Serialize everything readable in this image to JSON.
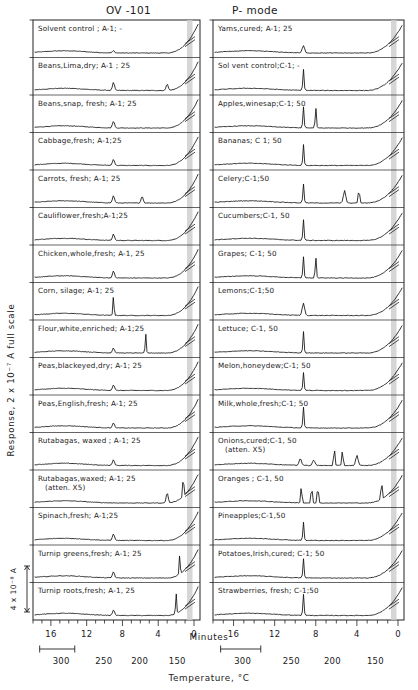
{
  "figure": {
    "column_headers": [
      "OV -101",
      "P- mode"
    ],
    "y_axis_label": "Response, 2 x 10⁻⁷ A full scale",
    "y_scale_bar_label": "4 x 10⁻⁸ A",
    "x_axis_label_top": "Minutes",
    "x_axis_label_bottom": "Temperature, °C"
  },
  "chart_data": {
    "type": "line",
    "xlabel": "Minutes",
    "xlabel_secondary": "Temperature, °C",
    "ylabel": "Response, 2 x 10⁻⁷ A full scale",
    "grid": false,
    "legend": "none",
    "axis_direction": "reversed",
    "xlim": [
      18,
      0
    ],
    "minutes_ticks": [
      16,
      12,
      8,
      4,
      0
    ],
    "minutes_minor_step": 1,
    "temperature_ticks": [
      300,
      250,
      200,
      150
    ],
    "temperature_scalebar_label": "300",
    "panels": [
      {
        "name": "OV -101",
        "column": "left",
        "traces": [
          {
            "label": "Solvent control ; A-1; -",
            "sample": "Solvent control",
            "column_code": "A-1",
            "injection": "-",
            "peaks": [
              {
                "minutes": 9.0,
                "height": 0.1
              }
            ]
          },
          {
            "label": "Beans,Lima,dry; A-1 ; 25",
            "sample": "Beans, Lima, dry",
            "column_code": "A-1",
            "injection": "25",
            "peaks": [
              {
                "minutes": 9.0,
                "height": 0.35
              },
              {
                "minutes": 3.0,
                "height": 0.3
              }
            ]
          },
          {
            "label": "Beans,snap, fresh; A-1; 25",
            "sample": "Beans, snap, fresh",
            "column_code": "A-1",
            "injection": "25",
            "peaks": [
              {
                "minutes": 9.0,
                "height": 0.3
              }
            ]
          },
          {
            "label": "Cabbage,fresh; A-1;25",
            "sample": "Cabbage, fresh",
            "column_code": "A-1",
            "injection": "25",
            "peaks": [
              {
                "minutes": 9.0,
                "height": 0.28
              }
            ]
          },
          {
            "label": "Carrots, fresh; A-1; 25",
            "sample": "Carrots, fresh",
            "column_code": "A-1",
            "injection": "25",
            "peaks": [
              {
                "minutes": 9.0,
                "height": 0.32
              },
              {
                "minutes": 5.8,
                "height": 0.3
              }
            ]
          },
          {
            "label": "Cauliflower,fresh;A-1;25",
            "sample": "Cauliflower, fresh",
            "column_code": "A-1",
            "injection": "25",
            "peaks": [
              {
                "minutes": 9.0,
                "height": 0.28
              }
            ]
          },
          {
            "label": "Chicken,whole,fresh; A-1, 25",
            "sample": "Chicken, whole, fresh",
            "column_code": "A-1",
            "injection": "25",
            "peaks": [
              {
                "minutes": 9.0,
                "height": 0.3
              }
            ]
          },
          {
            "label": "Corn, silage; A-1; 25",
            "sample": "Corn, silage",
            "column_code": "A-1",
            "injection": "25",
            "peaks": [
              {
                "minutes": 9.0,
                "height": 0.9
              }
            ]
          },
          {
            "label": "Flour,white,enriched; A-1;25",
            "sample": "Flour, white, enriched",
            "column_code": "A-1",
            "injection": "25",
            "peaks": [
              {
                "minutes": 9.0,
                "height": 0.22
              },
              {
                "minutes": 5.4,
                "height": 0.85
              }
            ]
          },
          {
            "label": "Peas,blackeyed,dry; A-1; 25",
            "sample": "Peas, blackeyed, dry",
            "column_code": "A-1",
            "injection": "25",
            "peaks": [
              {
                "minutes": 9.0,
                "height": 0.25
              }
            ]
          },
          {
            "label": "Peas,English,fresh; A-1; 25",
            "sample": "Peas, English, fresh",
            "column_code": "A-1",
            "injection": "25",
            "peaks": [
              {
                "minutes": 9.0,
                "height": 0.22
              }
            ]
          },
          {
            "label": "Rutabagas, waxed ; A-1; 25",
            "sample": "Rutabagas, waxed",
            "column_code": "A-1",
            "injection": "25",
            "peaks": [
              {
                "minutes": 9.0,
                "height": 0.25
              }
            ]
          },
          {
            "label": "Rutabagas,waxed; A-1; 25",
            "label2": "(atten. X5)",
            "sample": "Rutabagas, waxed",
            "column_code": "A-1",
            "injection": "25",
            "attenuation": "X5",
            "peaks": [
              {
                "minutes": 3.0,
                "height": 0.45
              },
              {
                "minutes": 1.2,
                "height": 0.95
              }
            ]
          },
          {
            "label": "Spinach,fresh; A-1;25",
            "sample": "Spinach, fresh",
            "column_code": "A-1",
            "injection": "25",
            "peaks": [
              {
                "minutes": 9.0,
                "height": 0.3
              }
            ]
          },
          {
            "label": "Turnip greens,fresh; A-1; 25",
            "sample": "Turnip greens, fresh",
            "column_code": "A-1",
            "injection": "25",
            "peaks": [
              {
                "minutes": 9.0,
                "height": 0.28
              },
              {
                "minutes": 1.6,
                "height": 0.85
              }
            ]
          },
          {
            "label": "Turnip roots,fresh; A-1, 25",
            "sample": "Turnip roots, fresh",
            "column_code": "A-1",
            "injection": "25",
            "peaks": [
              {
                "minutes": 9.0,
                "height": 0.25
              },
              {
                "minutes": 2.0,
                "height": 0.9
              }
            ]
          }
        ]
      },
      {
        "name": "P- mode",
        "column": "right",
        "traces": [
          {
            "label": "Yams,cured; A-1; 25",
            "sample": "Yams, cured",
            "column_code": "A-1",
            "injection": "25",
            "peaks": [
              {
                "minutes": 9.2,
                "height": 0.32
              }
            ]
          },
          {
            "label": "Sol vent control;C-1; -",
            "sample": "Solvent control",
            "column_code": "C-1",
            "injection": "-",
            "peaks": [
              {
                "minutes": 9.2,
                "height": 0.95
              }
            ]
          },
          {
            "label": "Apples,winesap;C-1;   50",
            "sample": "Apples, winesap",
            "column_code": "C-1",
            "injection": "50",
            "peaks": [
              {
                "minutes": 9.2,
                "height": 0.95
              },
              {
                "minutes": 8.0,
                "height": 0.9
              }
            ]
          },
          {
            "label": "Bananas; C 1; 50",
            "sample": "Bananas",
            "column_code": "C-1",
            "injection": "50",
            "peaks": [
              {
                "minutes": 9.2,
                "height": 0.92
              }
            ]
          },
          {
            "label": "Celery;C-1;50",
            "sample": "Celery",
            "column_code": "C-1",
            "injection": "50",
            "peaks": [
              {
                "minutes": 9.2,
                "height": 0.85
              },
              {
                "minutes": 5.2,
                "height": 0.55
              },
              {
                "minutes": 3.8,
                "height": 0.7
              }
            ]
          },
          {
            "label": "Cucumbers;C-1, 50",
            "sample": "Cucumbers",
            "column_code": "C-1",
            "injection": "50",
            "peaks": [
              {
                "minutes": 9.2,
                "height": 0.92
              }
            ]
          },
          {
            "label": "Grapes; C-1; 50",
            "sample": "Grapes",
            "column_code": "C-1",
            "injection": "50",
            "peaks": [
              {
                "minutes": 9.2,
                "height": 0.95
              },
              {
                "minutes": 8.0,
                "height": 0.92
              }
            ]
          },
          {
            "label": "Lemons;C-1;50",
            "sample": "Lemons",
            "column_code": "C-1",
            "injection": "50",
            "peaks": [
              {
                "minutes": 9.2,
                "height": 0.55
              }
            ]
          },
          {
            "label": "Lettuce; C-1, 50",
            "sample": "Lettuce",
            "column_code": "C-1",
            "injection": "50",
            "peaks": [
              {
                "minutes": 9.2,
                "height": 0.95
              }
            ]
          },
          {
            "label": "Melon,honeydew;C-1; 50",
            "sample": "Melon, honeydew",
            "column_code": "C-1",
            "injection": "50",
            "peaks": [
              {
                "minutes": 9.2,
                "height": 0.8
              }
            ]
          },
          {
            "label": "Milk,whole,fresh;C-1; 50",
            "sample": "Milk, whole, fresh",
            "column_code": "C-1",
            "injection": "50",
            "peaks": [
              {
                "minutes": 9.2,
                "height": 0.92
              }
            ]
          },
          {
            "label": "Onions,cured;C-1, 50",
            "label2": "(atten. X5)",
            "sample": "Onions, cured",
            "column_code": "C-1",
            "injection": "50",
            "attenuation": "X5",
            "peaks": [
              {
                "minutes": 9.5,
                "height": 0.3
              },
              {
                "minutes": 8.2,
                "height": 0.25
              },
              {
                "minutes": 6.2,
                "height": 0.8
              },
              {
                "minutes": 5.4,
                "height": 0.7
              },
              {
                "minutes": 4.0,
                "height": 0.45
              }
            ]
          },
          {
            "label": "Oranges ; C-1, 50",
            "sample": "Oranges",
            "column_code": "C-1",
            "injection": "50",
            "peaks": [
              {
                "minutes": 9.4,
                "height": 0.75
              },
              {
                "minutes": 8.4,
                "height": 0.8
              },
              {
                "minutes": 7.8,
                "height": 0.8
              },
              {
                "minutes": 1.6,
                "height": 0.8
              }
            ]
          },
          {
            "label": "Pineapples;C-1,50",
            "sample": "Pineapples",
            "column_code": "C-1",
            "injection": "50",
            "peaks": [
              {
                "minutes": 9.2,
                "height": 0.82
              }
            ]
          },
          {
            "label": "Potatoes,Irish,cured;   C-1; 50",
            "sample": "Potatoes, Irish, cured",
            "column_code": "C-1",
            "injection": "50",
            "peaks": [
              {
                "minutes": 9.2,
                "height": 0.85
              }
            ]
          },
          {
            "label": "Strawberries, fresh;  C-1;50",
            "sample": "Strawberries, fresh",
            "column_code": "C-1",
            "injection": "50",
            "peaks": [
              {
                "minutes": 9.2,
                "height": 0.95
              }
            ]
          }
        ]
      }
    ]
  }
}
